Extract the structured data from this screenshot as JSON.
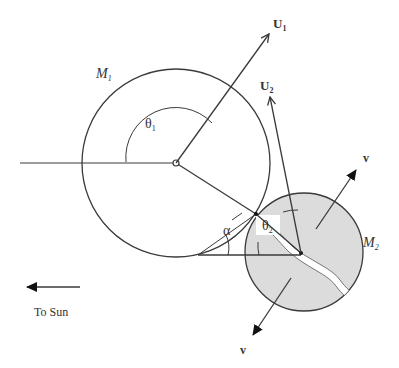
{
  "diagram": {
    "colors": {
      "line": "#3a3a3a",
      "body2_fill": "#dcdcdc",
      "crack_fill": "#ffffff",
      "background": "#ffffff"
    },
    "bodies": [
      {
        "id": "M1",
        "label_main": "M",
        "label_sub": "1",
        "center": [
          176,
          163
        ],
        "radius": 94,
        "filled": false
      },
      {
        "id": "M2",
        "label_main": "M",
        "label_sub": "2",
        "center": [
          304,
          252
        ],
        "radius": 59,
        "filled": true
      }
    ],
    "vectors": [
      {
        "id": "U1",
        "label_main": "U",
        "label_sub": "1"
      },
      {
        "id": "U2",
        "label_main": "U",
        "label_sub": "2"
      },
      {
        "id": "v_up",
        "label": "v"
      },
      {
        "id": "v_down",
        "label": "v"
      }
    ],
    "angles": {
      "theta1": {
        "main": "θ",
        "sub": "1"
      },
      "theta2": {
        "main": "θ",
        "sub": "2"
      },
      "alpha": "α"
    },
    "direction": {
      "label": "To Sun"
    }
  }
}
